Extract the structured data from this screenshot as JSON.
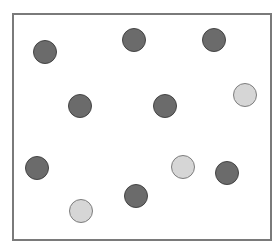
{
  "diagram": {
    "frame": {
      "x": 12,
      "y": 13,
      "width": 256,
      "height": 224,
      "border_color": "#7a7a7a"
    },
    "colors": {
      "dark": "#6b6b6b",
      "dark_border": "#444444",
      "light": "#d6d6d6",
      "light_border": "#7d7d7d"
    },
    "dots": [
      {
        "x": 45,
        "y": 52,
        "shade": "dark"
      },
      {
        "x": 134,
        "y": 40,
        "shade": "dark"
      },
      {
        "x": 214,
        "y": 40,
        "shade": "dark"
      },
      {
        "x": 80,
        "y": 106,
        "shade": "dark"
      },
      {
        "x": 165,
        "y": 106,
        "shade": "dark"
      },
      {
        "x": 245,
        "y": 95,
        "shade": "light"
      },
      {
        "x": 37,
        "y": 168,
        "shade": "dark"
      },
      {
        "x": 183,
        "y": 167,
        "shade": "light"
      },
      {
        "x": 227,
        "y": 173,
        "shade": "dark"
      },
      {
        "x": 136,
        "y": 196,
        "shade": "dark"
      },
      {
        "x": 81,
        "y": 211,
        "shade": "light"
      }
    ],
    "counts": {
      "dark": 8,
      "light": 3,
      "total": 11
    }
  }
}
